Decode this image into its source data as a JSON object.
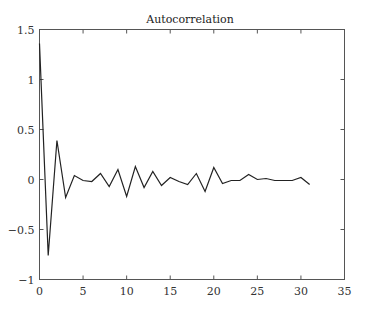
{
  "chart_data": {
    "type": "line",
    "title": "Autocorrelation",
    "xlabel": "",
    "ylabel": "",
    "xlim": [
      0,
      35
    ],
    "ylim": [
      -1,
      1.5
    ],
    "grid": false,
    "legend": null,
    "x_ticks": [
      0,
      5,
      10,
      15,
      20,
      25,
      30,
      35
    ],
    "x_tick_labels": [
      "0",
      "5",
      "10",
      "15",
      "20",
      "25",
      "30",
      "35"
    ],
    "y_ticks": [
      -1,
      -0.5,
      0,
      0.5,
      1,
      1.5
    ],
    "y_tick_labels": [
      "−1",
      "−0.5",
      "0",
      "0.5",
      "1",
      "1.5"
    ],
    "series": [
      {
        "name": "autocorrelation",
        "color": "#222222",
        "x": [
          0,
          1,
          2,
          3,
          4,
          5,
          6,
          7,
          8,
          9,
          10,
          11,
          12,
          13,
          14,
          15,
          16,
          17,
          18,
          19,
          20,
          21,
          22,
          23,
          24,
          25,
          26,
          27,
          28,
          29,
          30,
          31
        ],
        "values": [
          1.36,
          -0.76,
          0.39,
          -0.18,
          0.04,
          -0.01,
          -0.02,
          0.06,
          -0.07,
          0.1,
          -0.17,
          0.13,
          -0.08,
          0.08,
          -0.06,
          0.02,
          -0.02,
          -0.05,
          0.06,
          -0.12,
          0.12,
          -0.04,
          -0.01,
          -0.01,
          0.05,
          0.0,
          0.01,
          -0.01,
          -0.01,
          -0.01,
          0.02,
          -0.05
        ]
      }
    ]
  }
}
